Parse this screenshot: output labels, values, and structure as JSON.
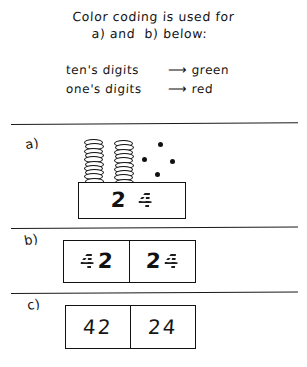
{
  "header": {
    "line1": "Color coding is used for",
    "line2": "a) and  b) below:"
  },
  "legend": {
    "rows": [
      {
        "term": "ten's digits",
        "arrow": "⟶",
        "color_word": "green",
        "color_hex": "#1f9d2f"
      },
      {
        "term": "one's digits",
        "arrow": "⟶",
        "color_word": "red",
        "color_hex": "#d62222"
      }
    ]
  },
  "sections": [
    {
      "letter": "a)",
      "manipulatives": {
        "tens_stacks": 2,
        "coins_per_stack": 10,
        "loose_ones_dots": 4
      },
      "box": {
        "tens_digit": "2",
        "ones_digit": "4"
      }
    },
    {
      "letter": "b)",
      "boxes": [
        {
          "first_digit": "4",
          "first_place": "ones",
          "second_digit": "2",
          "second_place": "tens",
          "value": "42"
        },
        {
          "first_digit": "2",
          "first_place": "tens",
          "second_digit": "4",
          "second_place": "ones",
          "value": "24"
        }
      ]
    },
    {
      "letter": "c)",
      "boxes": [
        {
          "value": "42"
        },
        {
          "value": "24"
        }
      ]
    }
  ]
}
